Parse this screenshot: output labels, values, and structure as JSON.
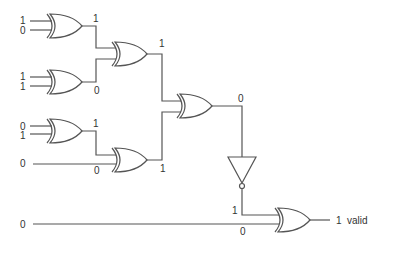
{
  "diagram": {
    "type": "logic-circuit",
    "gates": [
      {
        "id": "xor1",
        "type": "XOR",
        "inputs": [
          "1",
          "0"
        ],
        "output": "1"
      },
      {
        "id": "xor2",
        "type": "XOR",
        "inputs": [
          "1",
          "1"
        ],
        "output": "0"
      },
      {
        "id": "xor3",
        "type": "XOR",
        "inputs": [
          "xor1",
          "xor2"
        ],
        "output": "1"
      },
      {
        "id": "xor4",
        "type": "XOR",
        "inputs": [
          "0",
          "1"
        ],
        "output": "1"
      },
      {
        "id": "xor5",
        "type": "XOR",
        "inputs": [
          "xor4",
          "0"
        ],
        "output": "1"
      },
      {
        "id": "xor6",
        "type": "XOR",
        "inputs": [
          "xor3",
          "xor5"
        ],
        "output": "0"
      },
      {
        "id": "not1",
        "type": "NOT",
        "inputs": [
          "xor6"
        ],
        "output": "1"
      },
      {
        "id": "xor7",
        "type": "XOR",
        "inputs": [
          "not1",
          "0"
        ],
        "output": "1"
      }
    ],
    "labels": {
      "in_a1": "1",
      "in_a2": "0",
      "in_b1": "1",
      "in_b2": "1",
      "in_c1": "0",
      "in_c2": "1",
      "in_d": "0",
      "in_e": "0",
      "out_g1": "1",
      "out_g2": "0",
      "out_g3": "1",
      "out_g4": "1",
      "in_g5_b": "0",
      "out_g5": "1",
      "out_g6": "0",
      "out_not": "1",
      "in_g7_b": "0",
      "final_value": "1",
      "final_name": "valid"
    }
  }
}
